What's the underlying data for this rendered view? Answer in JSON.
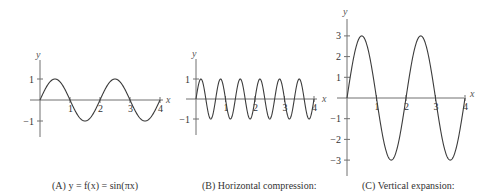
{
  "chart_data": [
    {
      "type": "line",
      "id": "A",
      "caption": "(A)  y = f(x) = sin(πx)",
      "function": "sin(pi*x)",
      "amplitude": 1,
      "frequency_multiplier": 1,
      "xlabel": "x",
      "ylabel": "y",
      "xlim": [
        0,
        4
      ],
      "ylim": [
        -1,
        1
      ],
      "x_ticks": [
        "1",
        "2",
        "3",
        "4"
      ],
      "y_ticks": [
        "1",
        "−1"
      ],
      "y_tick_values": [
        1,
        -1
      ],
      "grid": false,
      "layout": {
        "ox": 40,
        "oy": 100,
        "ux": 30,
        "uy": 21,
        "ytop": 60,
        "ybot": 137,
        "xend": 163
      }
    },
    {
      "type": "line",
      "id": "B",
      "caption": "(B) Horizontal compression:",
      "function": "sin(3*pi*x)",
      "amplitude": 1,
      "frequency_multiplier": 3,
      "xlabel": "x",
      "ylabel": "y",
      "xlim": [
        0,
        4
      ],
      "ylim": [
        -1,
        1
      ],
      "x_ticks": [
        "1",
        "2",
        "3",
        "4"
      ],
      "y_ticks": [
        "1",
        "−1"
      ],
      "y_tick_values": [
        1,
        -1
      ],
      "grid": false,
      "layout": {
        "ox": 196,
        "oy": 99,
        "ux": 29.5,
        "uy": 20,
        "ytop": 59,
        "ybot": 135,
        "xend": 317
      }
    },
    {
      "type": "line",
      "id": "C",
      "caption": "(C) Vertical expansion:",
      "function": "3*sin(pi*x)",
      "amplitude": 3,
      "frequency_multiplier": 1,
      "xlabel": "x",
      "ylabel": "y",
      "xlim": [
        0,
        4
      ],
      "ylim": [
        -3,
        3
      ],
      "x_ticks": [
        "1",
        "2",
        "3",
        "4"
      ],
      "y_ticks": [
        "3",
        "2",
        "1",
        "−1",
        "−2",
        "−3"
      ],
      "y_tick_values": [
        3,
        2,
        1,
        -1,
        -2,
        -3
      ],
      "grid": false,
      "layout": {
        "ox": 347,
        "oy": 98,
        "ux": 29.5,
        "uy": 20.7,
        "ytop": 19,
        "ybot": 176,
        "xend": 464
      }
    }
  ],
  "panels": {
    "A": {
      "caption": "(A)  y = f(x) = sin(πx)",
      "ylabel": "y",
      "xlabel": "x"
    },
    "B": {
      "caption": "(B) Horizontal compression:",
      "ylabel": "y",
      "xlabel": "x"
    },
    "C": {
      "caption": "(C) Vertical expansion:",
      "ylabel": "y",
      "xlabel": "x"
    }
  }
}
